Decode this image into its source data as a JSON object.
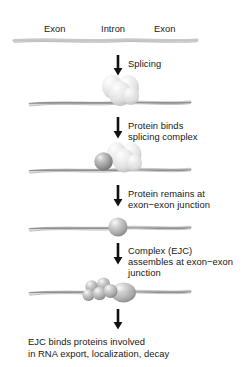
{
  "figure": {
    "background_color": "#ffffff",
    "text_color": "#171717",
    "strand_color": "#8c8c8c",
    "arrow_color": "#111111",
    "protein_dark_color": "#9a9a9a",
    "protein_light_color": "#e2e2e2"
  },
  "segments": {
    "exon_left": "Exon",
    "intron": "Intron",
    "exon_right": "Exon"
  },
  "steps": [
    {
      "id": "splicing",
      "arrow": "down-arrow-icon",
      "lines": [
        "Splicing"
      ]
    },
    {
      "id": "protein-binds",
      "arrow": "down-arrow-icon",
      "lines": [
        "Protein binds",
        "splicing complex"
      ]
    },
    {
      "id": "protein-remains",
      "arrow": "down-arrow-icon",
      "lines": [
        "Protein remains at",
        "exon−exon junction"
      ]
    },
    {
      "id": "ejc-assembles",
      "arrow": "down-arrow-icon",
      "lines": [
        "Complex (EJC)",
        "assembles at exon−exon",
        "junction"
      ]
    },
    {
      "id": "ejc-binds",
      "arrow": "down-arrow-icon",
      "lines": []
    }
  ],
  "conclusion": {
    "line1": "EJC binds proteins involved",
    "line2": "in RNA export, localization, decay"
  },
  "stages": [
    {
      "id": "pre-mrna-strand",
      "caption": "Unspliced pre-mRNA with exon−intron−exon structure",
      "proteins": 0
    },
    {
      "id": "spliced-strand-with-spliceosome",
      "caption": "Spliced RNA bound by splicing complex",
      "proteins": 4
    },
    {
      "id": "strand-with-protein-and-spliceosome",
      "caption": "Protein binds the splicing complex",
      "proteins": 5
    },
    {
      "id": "strand-with-single-protein",
      "caption": "Single protein remains at exon−exon junction",
      "proteins": 1
    },
    {
      "id": "strand-with-ejc-cluster",
      "caption": "EJC cluster assembled at exon−exon junction",
      "proteins": 6
    }
  ]
}
